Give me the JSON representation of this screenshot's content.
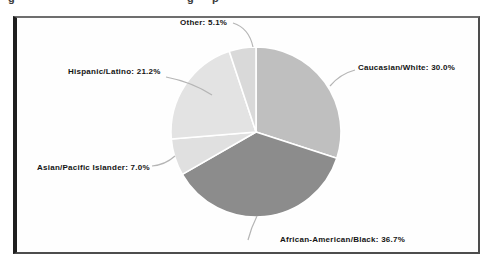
{
  "page": {
    "cropped_caption": {
      "visible_descender_glyphs": [
        "g",
        "g",
        "p"
      ]
    }
  },
  "colors": {
    "background": "#ffffff",
    "frame_border": "#4d4d4d",
    "frame_border_left": "#1f1f1f",
    "label_text": "#141414",
    "leader_line": "#b5b5b5",
    "slice_divider": "#ffffff"
  },
  "chart_data": {
    "type": "pie",
    "title": "",
    "categories": [
      "Caucasian/White",
      "African-American/Black",
      "Asian/Pacific Islander",
      "Hispanic/Latino",
      "Other"
    ],
    "values": [
      30.0,
      36.7,
      7.0,
      21.2,
      5.1
    ],
    "slices": [
      {
        "label": "Caucasian/White",
        "value": 30.0,
        "display": "Caucasian/White: 30.0%",
        "color": "#bfbfbf"
      },
      {
        "label": "African-American/Black",
        "value": 36.7,
        "display": "African-American/Black: 36.7%",
        "color": "#8c8c8c"
      },
      {
        "label": "Asian/Pacific Islander",
        "value": 7.0,
        "display": "Asian/Pacific Islander: 7.0%",
        "color": "#e0e0e0"
      },
      {
        "label": "Hispanic/Latino",
        "value": 21.2,
        "display": "Hispanic/Latino: 21.2%",
        "color": "#e3e3e3"
      },
      {
        "label": "Other",
        "value": 5.1,
        "display": "Other: 5.1%",
        "color": "#d9d9d9"
      }
    ],
    "units": "percent",
    "start_angle_deg": 0,
    "direction": "clockwise",
    "legend_position": "none",
    "label_style": "outside-callout"
  }
}
